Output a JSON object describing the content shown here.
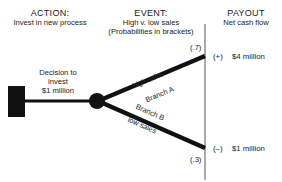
{
  "headers": {
    "action": {
      "title": "ACTION:",
      "subtitle": "Invest in new process"
    },
    "event": {
      "title": "EVENT:",
      "subtitle_1": "High v. low sales",
      "subtitle_2": "(Probabilities in brackets)"
    },
    "payout": {
      "title": "PAYOUT",
      "subtitle": "Net cash flow"
    }
  },
  "decision": {
    "line_1": "Decision to",
    "line_2": "invest",
    "line_3": "$1 million"
  },
  "branches": {
    "upper": {
      "label_top": "high sales",
      "label_bottom": "Branch A",
      "probability": "(.7)",
      "sign": "(+)",
      "payout": "$4 million"
    },
    "lower": {
      "label_top": "Branch B",
      "label_bottom": "low sales",
      "probability": "(.3)",
      "sign": "(–)",
      "payout": "$1 million"
    }
  },
  "colors": {
    "ink": "#111111",
    "text": "#222222",
    "background": "#ffffff"
  }
}
